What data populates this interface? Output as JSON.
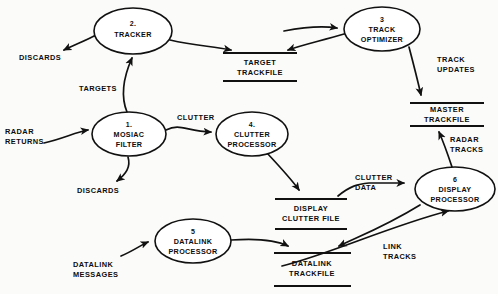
{
  "diagram": {
    "type": "data-flow-diagram",
    "title": "",
    "colors": {
      "ink": "#111111",
      "paper": "#fbfbf9"
    },
    "processes": [
      {
        "id": "tracker",
        "num": "2.",
        "line1": "TRACKER",
        "line2": "",
        "cx": 133,
        "cy": 31,
        "rx": 39,
        "ry": 23
      },
      {
        "id": "mosiac-filter",
        "num": "1.",
        "line1": "MOSIAC",
        "line2": "FILTER",
        "cx": 129,
        "cy": 134,
        "rx": 37,
        "ry": 22
      },
      {
        "id": "track-optimizer",
        "num": "3",
        "line1": "TRACK",
        "line2": "OPTIMIZER",
        "cx": 382,
        "cy": 29,
        "rx": 38,
        "ry": 22
      },
      {
        "id": "clutter-processor",
        "num": "4.",
        "line1": "CLUTTER",
        "line2": "PROCESSOR",
        "cx": 252,
        "cy": 134,
        "rx": 36,
        "ry": 22
      },
      {
        "id": "datalink-processor",
        "num": "5",
        "line1": "DATALINK",
        "line2": "PROCESSOR",
        "cx": 193,
        "cy": 241,
        "rx": 38,
        "ry": 22
      },
      {
        "id": "display-processor",
        "num": "6",
        "line1": "DISPLAY",
        "line2": "PROCESSOR",
        "cx": 455,
        "cy": 189,
        "rx": 40,
        "ry": 22
      }
    ],
    "stores": [
      {
        "id": "target-trackfile",
        "line1": "TARGET",
        "line2": "TRACKFILE",
        "x1": 223,
        "x2": 297,
        "ytop": 53,
        "ybot": 81
      },
      {
        "id": "master-trackfile",
        "line1": "MASTER",
        "line2": "TRACKFILE",
        "x1": 410,
        "x2": 484,
        "ytop": 103,
        "ybot": 126
      },
      {
        "id": "display-clutter-file",
        "line1": "DISPLAY",
        "line2": "CLUTTER FILE",
        "x1": 275,
        "x2": 347,
        "ytop": 199,
        "ybot": 229
      },
      {
        "id": "datalink-trackfile",
        "line1": "DATALINK",
        "line2": "TRACKFILE",
        "x1": 274,
        "x2": 351,
        "ytop": 253,
        "ybot": 286
      }
    ],
    "flows": [
      {
        "id": "discards-tracker",
        "label_line1": "DISCARDS",
        "label_line2": "",
        "lx": 48,
        "ly": 58
      },
      {
        "id": "targets",
        "label_line1": "TARGETS",
        "label_line2": "",
        "lx": 112,
        "ly": 89
      },
      {
        "id": "radar-returns",
        "label_line1": "RADAR",
        "label_line2": "RETURNS",
        "lx": 5,
        "ly": 131
      },
      {
        "id": "discards-mosiac",
        "label_line1": "DISCARDS",
        "label_line2": "",
        "lx": 79,
        "ly": 191
      },
      {
        "id": "clutter",
        "label_line1": "CLUTTER",
        "label_line2": "",
        "lx": 199,
        "ly": 119
      },
      {
        "id": "track-updates",
        "label_line1": "TRACK",
        "label_line2": "UPDATES",
        "lx": 437,
        "ly": 62
      },
      {
        "id": "radar-tracks",
        "label_line1": "RADAR",
        "label_line2": "TRACKS",
        "lx": 450,
        "ly": 142
      },
      {
        "id": "clutter-data",
        "label_line1": "CLUTTER",
        "label_line2": "DATA",
        "lx": 358,
        "ly": 180
      },
      {
        "id": "link-tracks",
        "label_line1": "LINK",
        "label_line2": "TRACKS",
        "lx": 386,
        "ly": 249
      },
      {
        "id": "datalink-messages",
        "label_line1": "DATALINK",
        "label_line2": "MESSAGES",
        "lx": 76,
        "ly": 265
      }
    ]
  }
}
